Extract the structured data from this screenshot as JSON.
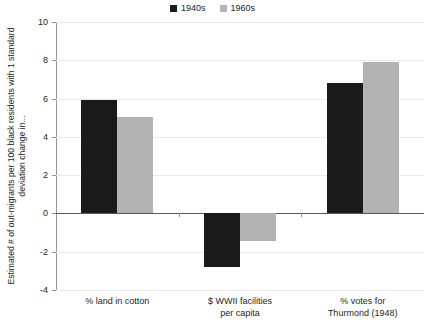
{
  "chart_data": {
    "type": "bar",
    "title": "",
    "subtitle": "",
    "xlabel": "",
    "ylabel": "Estimated # of out-migrants per 100 black residents with 1 standard deviation change in...",
    "categories": [
      "% land in cotton",
      "$ WWII facilities per capita",
      "% votes for Thurmond (1948)"
    ],
    "category_lines": [
      [
        "% land in cotton"
      ],
      [
        "$ WWII facilities",
        "per capita"
      ],
      [
        "% votes for",
        "Thurmond (1948)"
      ]
    ],
    "series": [
      {
        "name": "1940s",
        "color": "#1a1a1a",
        "values": [
          5.95,
          -2.8,
          6.8
        ]
      },
      {
        "name": "1960s",
        "color": "#b3b3b3",
        "values": [
          5.05,
          -1.45,
          7.9
        ]
      }
    ],
    "ylim": [
      -4,
      10
    ],
    "yticks": [
      10,
      8,
      6,
      4,
      2,
      0,
      -2,
      -4
    ],
    "ytick_labels": [
      "10",
      "8",
      "6",
      "4",
      "2",
      "0",
      "-2",
      "-4"
    ],
    "grid": true,
    "grid_axis": "y",
    "legend_position": "top-center",
    "zero_line": 0
  },
  "legend": {
    "entries": [
      {
        "label": "1940s",
        "color": "#1a1a1a"
      },
      {
        "label": "1960s",
        "color": "#b3b3b3"
      }
    ]
  },
  "colors": {
    "series_1940s": "#1a1a1a",
    "series_1960s": "#b3b3b3",
    "grid": "#e9e9e9",
    "axis": "#939598",
    "zero_line": "#58595b",
    "text": "#231f20",
    "background": "#ffffff"
  }
}
